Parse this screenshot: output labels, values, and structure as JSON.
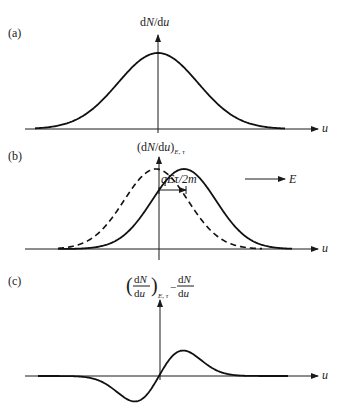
{
  "panels": [
    {
      "id": "a",
      "label": "(a)",
      "y_axis_label": "dN/du",
      "x_axis_label": "u",
      "curves": [
        {
          "name": "equilibrium distribution",
          "style": "solid",
          "shape": "gaussian",
          "center": 0,
          "peak": 1.0
        }
      ]
    },
    {
      "id": "b",
      "label": "(b)",
      "y_axis_label_main": "(dN/du)",
      "y_axis_label_sub": "E, τ",
      "x_axis_label": "u",
      "shift_label": "qEτ/2m",
      "field_label": "E",
      "curves": [
        {
          "name": "equilibrium distribution",
          "style": "dashed",
          "shape": "gaussian",
          "center": 0,
          "peak": 1.0
        },
        {
          "name": "shifted distribution",
          "style": "solid",
          "shape": "gaussian",
          "center": 0.3,
          "peak": 1.0
        }
      ]
    },
    {
      "id": "c",
      "label": "(c)",
      "y_axis_label_frac1_num": "dN",
      "y_axis_label_frac1_den": "du",
      "y_axis_label_sub": "E, τ",
      "y_axis_label_minus": "−",
      "y_axis_label_frac2_num": "dN",
      "y_axis_label_frac2_den": "du",
      "x_axis_label": "u",
      "curves": [
        {
          "name": "difference distribution",
          "style": "solid",
          "shape": "derivative-of-gaussian",
          "min": -0.4,
          "max": 0.4
        }
      ]
    }
  ]
}
